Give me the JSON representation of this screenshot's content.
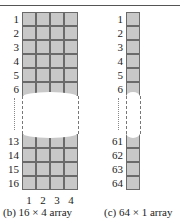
{
  "figure_b": {
    "caption": "(b)  16 × 4 array",
    "rows": 16,
    "cols": 4,
    "row_labels_top": [
      "1",
      "2",
      "3",
      "4",
      "5",
      "6"
    ],
    "row_labels_bottom": [
      "13",
      "14",
      "15",
      "16"
    ],
    "col_labels": [
      "1",
      "2",
      "3",
      "4"
    ]
  },
  "figure_c": {
    "caption": "(c)  64 × 1 array",
    "rows": 64,
    "cols": 1,
    "row_labels_top": [
      "1",
      "2",
      "3",
      "4",
      "5",
      "6"
    ],
    "row_labels_bottom": [
      "61",
      "62",
      "63",
      "64"
    ]
  },
  "colors": {
    "cell_fill": "#c8c8c8",
    "cell_border": "#6a6a6a",
    "rule": "#555555"
  }
}
